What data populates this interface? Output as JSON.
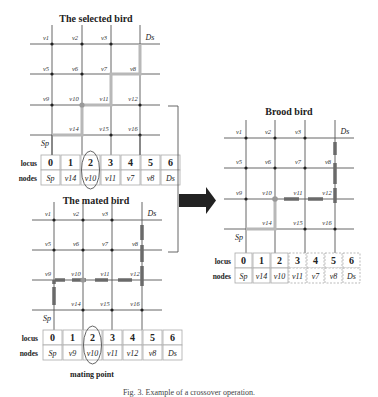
{
  "figure": {
    "caption": "Fig. 3. Example of a crossover operation.",
    "mating_point_label": "mating point",
    "row_labels": {
      "locus": "locus",
      "nodes": "nodes"
    },
    "colors": {
      "grid": "#555555",
      "selected_path": "#b8b8b8",
      "mated_path": "#6a6a6a",
      "node_dot": "#222222",
      "arrow": "#222222",
      "table_border": "#aaaaaa"
    }
  },
  "selected_bird": {
    "title": "The selected bird",
    "grid_labels": [
      "v1",
      "v2",
      "v3",
      "Ds",
      "v5",
      "v6",
      "v7",
      "v8",
      "v9",
      "v10",
      "v11",
      "v12",
      "",
      "v14",
      "v15",
      "v16"
    ],
    "start_label": "Sp",
    "dest_label": "Ds",
    "path": [
      "Sp",
      "v14",
      "v10",
      "v11",
      "v7",
      "v8",
      "Ds"
    ],
    "locus": [
      "0",
      "1",
      "2",
      "3",
      "4",
      "5",
      "6"
    ],
    "nodes": [
      "Sp",
      "v14",
      "v10",
      "v11",
      "v7",
      "v8",
      "Ds"
    ],
    "highlight_locus": 2
  },
  "mated_bird": {
    "title": "The mated bird",
    "grid_labels": [
      "v1",
      "v2",
      "v3",
      "Ds",
      "v5",
      "v6",
      "v7",
      "v8",
      "v9",
      "v10",
      "v11",
      "v12",
      "",
      "v14",
      "v15",
      "v16"
    ],
    "start_label": "Sp",
    "dest_label": "Ds",
    "path": [
      "Sp",
      "v9",
      "v10",
      "v11",
      "v12",
      "v8",
      "Ds"
    ],
    "locus": [
      "0",
      "1",
      "2",
      "3",
      "4",
      "5",
      "6"
    ],
    "nodes": [
      "Sp",
      "v9",
      "v10",
      "v11",
      "v12",
      "v8",
      "Ds"
    ],
    "highlight_locus": 2
  },
  "brood_bird": {
    "title": "Brood bird",
    "grid_labels": [
      "v1",
      "v2",
      "v3",
      "Ds",
      "v5",
      "v6",
      "v7",
      "v8",
      "v9",
      "v10",
      "v11",
      "v12",
      "",
      "v14",
      "v15",
      "v16"
    ],
    "start_label": "Sp",
    "dest_label": "Ds",
    "path": [
      "Sp",
      "v14",
      "v10",
      "v11",
      "v12",
      "v8",
      "Ds"
    ],
    "locus": [
      "0",
      "1",
      "2",
      "3",
      "4",
      "5",
      "6"
    ],
    "nodes": [
      "Sp",
      "v14",
      "v10",
      "v11",
      "v7",
      "v8",
      "Ds"
    ],
    "inherited_from_selected": [
      0,
      1,
      2
    ],
    "inherited_from_mated": [
      3,
      4,
      5,
      6
    ]
  }
}
